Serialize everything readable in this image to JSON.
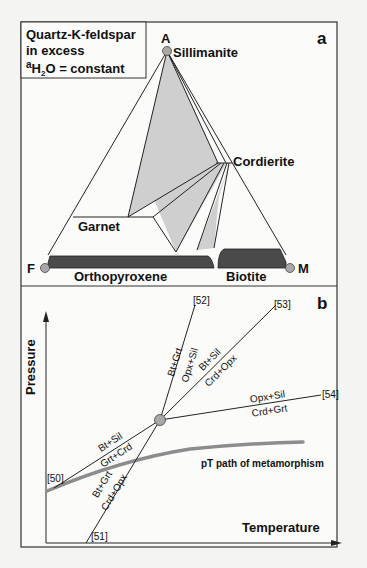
{
  "panel_a": {
    "label": "a",
    "legend": {
      "line1": "Quartz-K-feldspar",
      "line2": "in excess",
      "line3_prefix": "a",
      "line3_sub": "H",
      "line3_sub2": "2",
      "line3_rest": "O = constant"
    },
    "vertices": {
      "apex": "A",
      "left": "F",
      "right": "M"
    },
    "phases": {
      "sillimanite": "Sillimanite",
      "cordierite": "Cordierite",
      "garnet": "Garnet",
      "orthopyroxene": "Orthopyroxene",
      "biotite": "Biotite"
    },
    "colors": {
      "fill_light": "#cfcfcf",
      "band_dark": "#4a4a4a",
      "node": "#a8a8a8"
    }
  },
  "panel_b": {
    "label": "b",
    "x_axis": "Temperature",
    "y_axis": "Pressure",
    "reactions": {
      "r52": {
        "id": "[52]",
        "upper": "Bt+Grt",
        "lower": "Opx+Sil"
      },
      "r53": {
        "id": "[53]",
        "upper": "Bt+Sil",
        "lower": "Crd+Opx"
      },
      "r54": {
        "id": "[54]",
        "upper": "Opx+Sil",
        "lower": "Crd+Grt"
      },
      "r50": {
        "id": "[50]",
        "upper": "Bt+Sil",
        "lower": "Grt+Crd"
      },
      "r51": {
        "id": "[51]",
        "upper": "Bt+Grt",
        "lower": "Crd+Opx"
      }
    },
    "path_label": "pT path of metamorphism",
    "colors": {
      "path": "#8c8c8c",
      "node": "#a8a8a8"
    }
  }
}
